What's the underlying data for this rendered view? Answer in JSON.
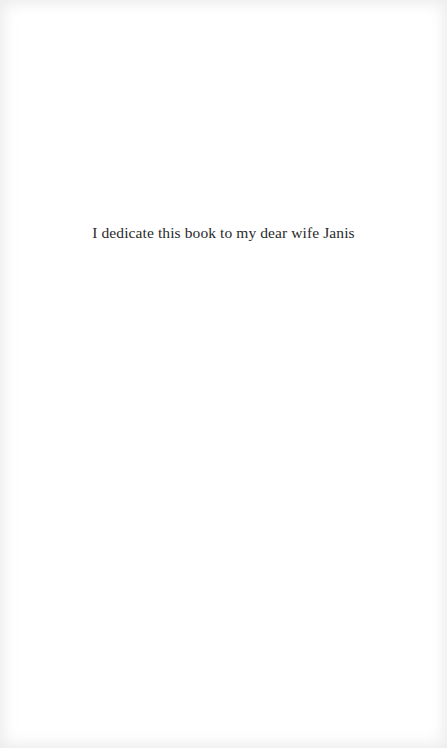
{
  "page": {
    "type": "dedication",
    "dedication_text": "I dedicate this book to my dear wife Janis"
  },
  "colors": {
    "background": "#ffffff",
    "text": "#2a2a2a"
  }
}
